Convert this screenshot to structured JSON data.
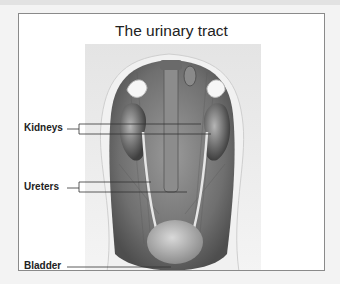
{
  "title": "The urinary tract",
  "labels": {
    "kidneys": "Kidneys",
    "ureters": "Ureters",
    "bladder": "Bladder"
  },
  "colors": {
    "background": "#f3f3f3",
    "frame_border": "#8a8a8a",
    "text": "#222222"
  }
}
